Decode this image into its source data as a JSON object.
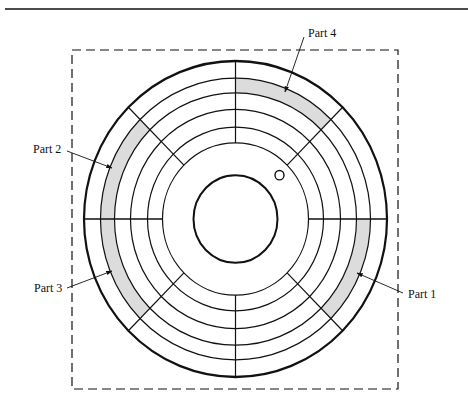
{
  "figure": {
    "type": "disk-platter-diagram",
    "colors": {
      "line": "#111111",
      "shade": "#dcdcdc",
      "background": "#ffffff"
    },
    "labels": [
      {
        "id": "part1",
        "text": "Part 1"
      },
      {
        "id": "part2",
        "text": "Part 2"
      },
      {
        "id": "part3",
        "text": "Part 3"
      },
      {
        "id": "part4",
        "text": "Part 4"
      }
    ],
    "tracks": 5,
    "sectors": 8
  }
}
